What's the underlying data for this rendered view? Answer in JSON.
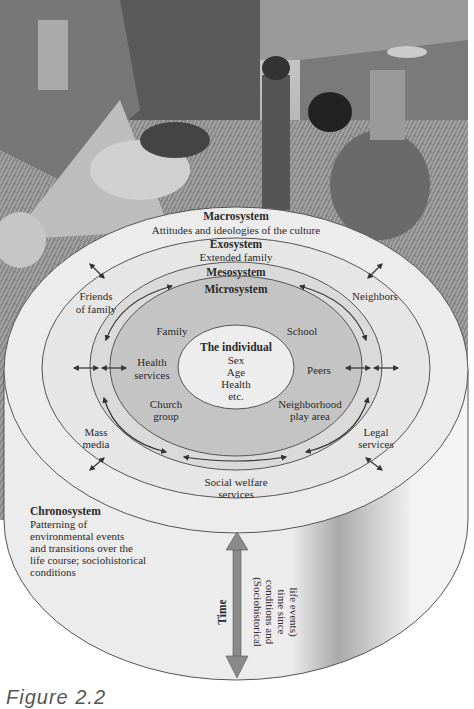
{
  "figure": {
    "caption": "Figure 2.2",
    "photo_description": "Black-and-white photo of people harvesting and threshing rice on terraced hillside"
  },
  "systems": {
    "macrosystem": {
      "title": "Macrosystem",
      "subtitle": "Attitudes and ideologies of the culture"
    },
    "exosystem": {
      "title": "Exosystem",
      "subtitle": "Extended family",
      "items": [
        "Friends of family",
        "Neighbors",
        "Mass media",
        "Legal services",
        "Social welfare services"
      ]
    },
    "mesosystem": {
      "title": "Mesosystem"
    },
    "microsystem": {
      "title": "Microsystem",
      "items": [
        "Family",
        "School",
        "Health services",
        "Peers",
        "Church group",
        "Neighborhood play area"
      ]
    },
    "individual": {
      "title": "The individual",
      "attributes": [
        "Sex",
        "Age",
        "Health",
        "etc."
      ]
    },
    "chronosystem": {
      "title": "Chronosystem",
      "description_lines": [
        "Patterning of",
        "environmental events",
        "and transitions over the",
        "life course; sociohistorical",
        "conditions"
      ],
      "time_label": "Time",
      "time_note_lines": [
        "(Sociohistorical",
        "conditions and",
        "time since",
        "life events)"
      ]
    }
  },
  "labels": {
    "friends_1": "Friends",
    "friends_2": "of family",
    "neighbors": "Neighbors",
    "mass_1": "Mass",
    "mass_2": "media",
    "legal_1": "Legal",
    "legal_2": "services",
    "welfare_1": "Social welfare",
    "welfare_2": "services",
    "family": "Family",
    "school": "School",
    "health_1": "Health",
    "health_2": "services",
    "peers": "Peers",
    "church_1": "Church",
    "church_2": "group",
    "nbhd_1": "Neighborhood",
    "nbhd_2": "play area"
  },
  "colors": {
    "macro_fill": "#ececec",
    "exo_fill": "#e6e6e6",
    "meso_fill": "#d9d9d9",
    "micro_fill": "#c4c4c4",
    "individual_fill": "#ededed",
    "time_arrow": "#8a8a8a",
    "outline": "#555555"
  }
}
